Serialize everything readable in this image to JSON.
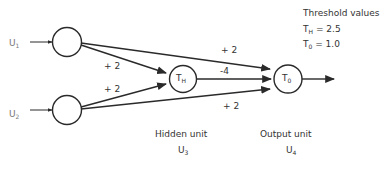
{
  "diagram": {
    "inputs": [
      {
        "id": "U1",
        "label": "U",
        "sub": "1"
      },
      {
        "id": "U2",
        "label": "U",
        "sub": "2"
      }
    ],
    "hidden_unit": {
      "symbol": "T",
      "sub": "H",
      "caption": "Hidden unit",
      "name": "U",
      "name_sub": "3"
    },
    "output_unit": {
      "symbol": "T",
      "sub": "0",
      "caption": "Output unit",
      "name": "U",
      "name_sub": "4"
    },
    "weights": {
      "u1_to_hidden": "+ 2",
      "u2_to_hidden": "+ 2",
      "u1_to_output": "+ 2",
      "u2_to_output": "+ 2",
      "hidden_to_output": "-4"
    },
    "thresholds": {
      "title": "Threshold values",
      "hidden": {
        "symbol": "T",
        "sub": "H",
        "value": "= 2.5"
      },
      "output": {
        "symbol": "T",
        "sub": "0",
        "value": "= 1.0"
      }
    }
  }
}
